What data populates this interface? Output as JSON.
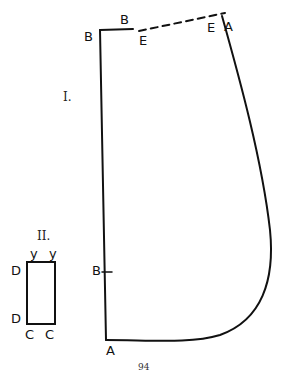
{
  "figure": {
    "piece_one": {
      "numeral": "I.",
      "labels": {
        "top_left_corner": "B",
        "top_step": "B",
        "dashed_start": "E",
        "dashed_end": "E",
        "top_right": "A",
        "mid_left_notch": "B",
        "bottom_left": "A"
      }
    },
    "piece_two": {
      "numeral": "II.",
      "labels": {
        "top_left": "y",
        "top_right": "y",
        "left_top": "D",
        "left_bottom": "D",
        "bottom_left": "C",
        "bottom_right": "C"
      }
    },
    "page_number": "94"
  }
}
